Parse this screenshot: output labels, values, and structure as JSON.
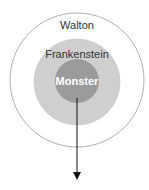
{
  "diagram": {
    "type": "nested-circles",
    "layers": [
      {
        "label": "Walton",
        "fill": "#ffffff",
        "stroke": "#9a9a9a"
      },
      {
        "label": "Frankenstein",
        "fill": "#cfcfcf",
        "stroke": "#bdbdbd"
      },
      {
        "label": "Monster",
        "fill": "#9b9b9b",
        "stroke": "#8f8f8f"
      }
    ],
    "arrow": {
      "direction": "down",
      "color": "#111111"
    },
    "colors": {
      "text_dark": "#333333",
      "text_light": "#ffffff"
    }
  }
}
